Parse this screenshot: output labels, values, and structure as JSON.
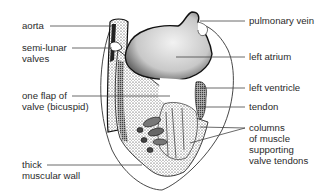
{
  "diagram": {
    "line_color": "#3a3a3a",
    "stipple_color": "#1a1a1a",
    "labels_left": [
      {
        "id": "aorta",
        "lines": [
          "aorta"
        ]
      },
      {
        "id": "semi-lunar-valves",
        "lines": [
          "semi-lunar",
          "valves"
        ]
      },
      {
        "id": "bicuspid-flap",
        "lines": [
          "one flap of",
          "valve (bicuspid)"
        ]
      },
      {
        "id": "muscular-wall",
        "lines": [
          "thick",
          "muscular wall"
        ]
      }
    ],
    "labels_right": [
      {
        "id": "pulmonary-vein",
        "lines": [
          "pulmonary vein"
        ]
      },
      {
        "id": "left-atrium",
        "lines": [
          "left atrium"
        ]
      },
      {
        "id": "left-ventricle",
        "lines": [
          "left ventricle"
        ]
      },
      {
        "id": "tendon",
        "lines": [
          "tendon"
        ]
      },
      {
        "id": "muscle-columns",
        "lines": [
          "columns",
          "of muscle",
          "supporting",
          "valve tendons"
        ]
      }
    ]
  }
}
